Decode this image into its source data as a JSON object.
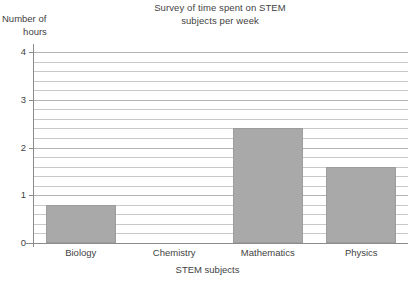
{
  "chart_data": {
    "type": "bar",
    "title": "Survey of time spent on STEM subjects per week",
    "title_lines": [
      "Survey of time spent on STEM",
      "subjects per week"
    ],
    "xlabel": "STEM subjects",
    "ylabel": "Number of hours",
    "ylabel_lines": [
      "Number of",
      "hours"
    ],
    "categories": [
      "Biology",
      "Chemistry",
      "Mathematics",
      "Physics"
    ],
    "values": [
      0.8,
      0,
      2.4,
      1.6
    ],
    "ylim": [
      0,
      4
    ],
    "ytick_labels": [
      "0",
      "1",
      "2",
      "3",
      "4"
    ],
    "ytick_values": [
      0,
      1,
      2,
      3,
      4
    ],
    "minor_gridline_step": 0.2,
    "grid": true,
    "legend": "none",
    "bar_color": "#a9a9a9",
    "axis_color": "#8b8b8b",
    "gridline_color": "#c9c9c9"
  }
}
